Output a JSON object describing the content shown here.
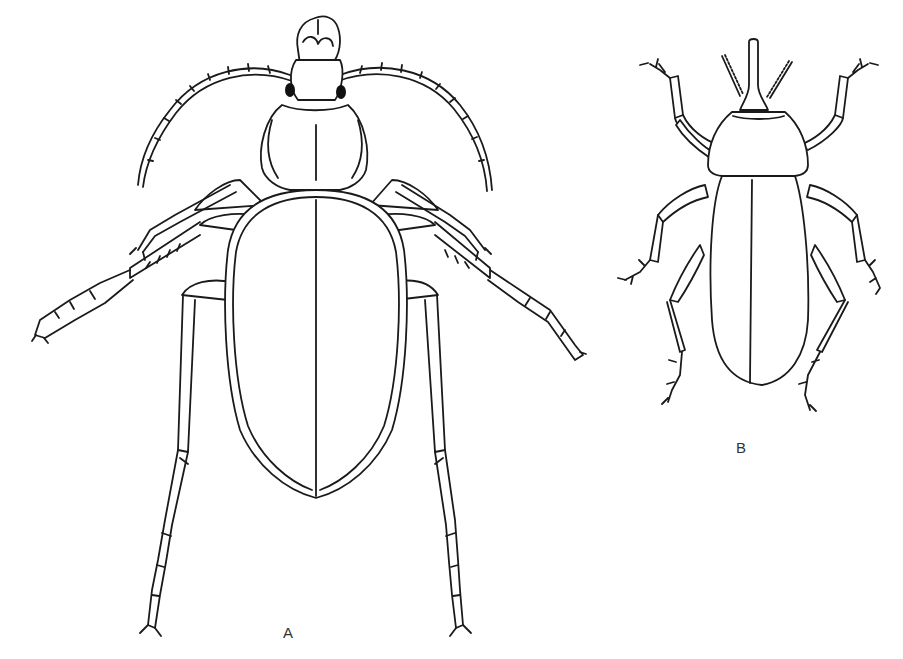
{
  "figure": {
    "type": "scientific line illustration",
    "panels": [
      {
        "id": "A",
        "label": "A",
        "subject": "ground-beetle",
        "label_color": "#333333"
      },
      {
        "id": "B",
        "label": "B",
        "subject": "weevil",
        "label_color": "#333333"
      }
    ],
    "line_color": "#1a1a1a",
    "background": "#ffffff"
  }
}
